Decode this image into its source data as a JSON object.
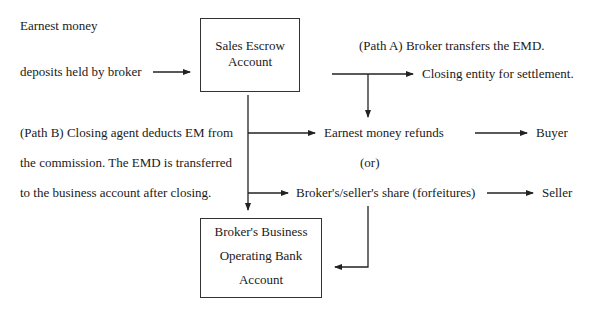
{
  "source": {
    "line1": "Earnest money",
    "line2": "deposits held by broker"
  },
  "escrow_box": {
    "line1": "Sales Escrow",
    "line2": "Account"
  },
  "path_a": {
    "label": "(Path A) Broker transfers the EMD.",
    "target": "Closing entity for settlement."
  },
  "path_b": {
    "line1": "(Path B) Closing agent deducts EM from",
    "line2": "the commission. The EMD is transferred",
    "line3": "to the business account after closing."
  },
  "outcomes": {
    "refunds": "Earnest money refunds",
    "or": "(or)",
    "forfeitures": "Broker's/seller's share (forfeitures)",
    "buyer": "Buyer",
    "seller": "Seller"
  },
  "operating_box": {
    "line1": "Broker's Business",
    "line2": "Operating Bank",
    "line3": "Account"
  },
  "colors": {
    "line": "#222222",
    "text": "#1a1a1a"
  }
}
